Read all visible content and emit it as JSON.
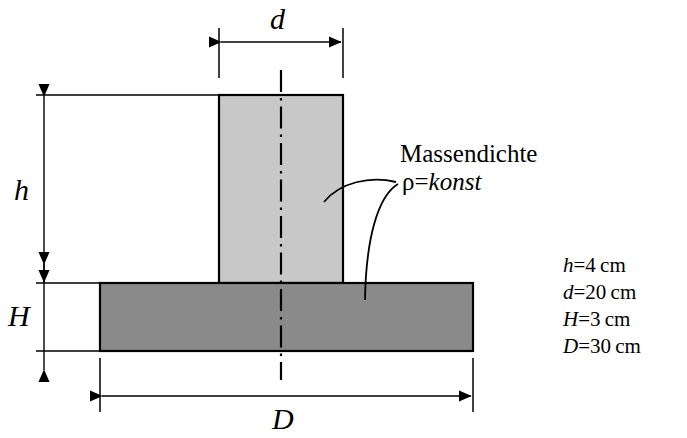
{
  "figure": {
    "background_color": "#ffffff",
    "line_color": "#000000"
  },
  "shapes": {
    "column": {
      "name": "Saeule",
      "fill": "#c8c8c8",
      "stroke": "#000000",
      "x": 219,
      "y": 95,
      "width": 124,
      "height": 188
    },
    "base_plate": {
      "name": "Grundplatte",
      "fill": "#8a8a8a",
      "stroke": "#000000",
      "x": 100,
      "y": 283,
      "width": 373,
      "height": 68
    }
  },
  "dimensions": {
    "d": {
      "symbol": "d",
      "orientation": "horizontal",
      "position": "top"
    },
    "h": {
      "symbol": "h",
      "orientation": "vertical",
      "position": "left"
    },
    "H": {
      "symbol": "H",
      "orientation": "vertical",
      "position": "left"
    },
    "D": {
      "symbol": "D",
      "orientation": "horizontal",
      "position": "bottom"
    }
  },
  "annotation": {
    "title": "Massendichte",
    "rho_symbol": "ρ",
    "equals": "=",
    "rho_value": "konst"
  },
  "parameters": [
    {
      "symbol": "h",
      "equals": "=",
      "value": "4",
      "unit": "cm"
    },
    {
      "symbol": "d",
      "equals": "=",
      "value": "20",
      "unit": "cm"
    },
    {
      "symbol": "H",
      "equals": "=",
      "value": "3",
      "unit": "cm"
    },
    {
      "symbol": "D",
      "equals": "=",
      "value": "30",
      "unit": "cm"
    }
  ]
}
